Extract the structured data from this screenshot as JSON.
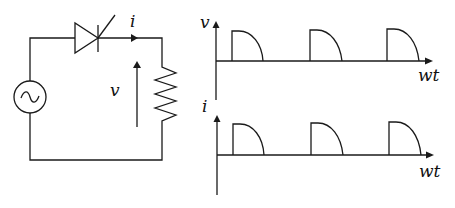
{
  "circuit": {
    "title": "Half-wave controlled rectifier (SCR) with resistive load",
    "components": {
      "source": "ac-voltage-source",
      "switch": "thyristor-scr",
      "load": "resistor"
    },
    "labels": {
      "current": "i",
      "voltage": "v"
    }
  },
  "waveforms": {
    "voltage_plot": {
      "ylabel": "v",
      "xlabel": "wt"
    },
    "current_plot": {
      "ylabel": "i",
      "xlabel": "wt"
    },
    "pulses_per_plot": 3
  },
  "colors": {
    "line": "#1a1a1a",
    "background": "#ffffff"
  }
}
